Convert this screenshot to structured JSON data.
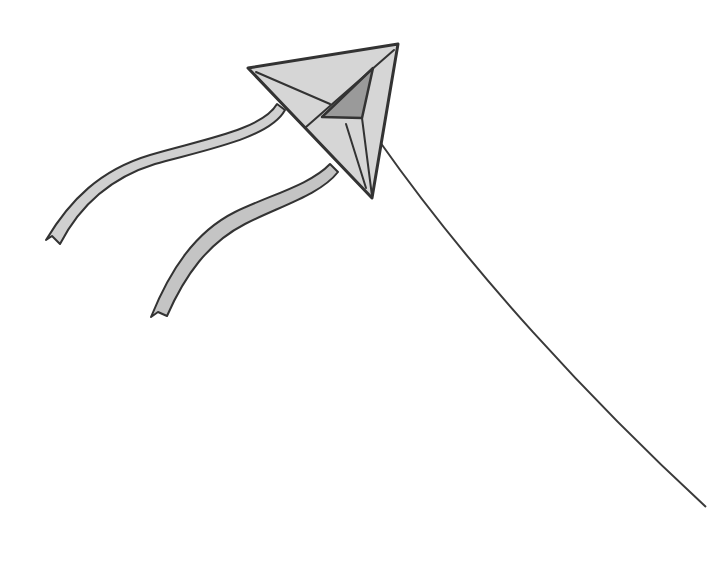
{
  "illustration": {
    "subject": "kite",
    "alt": "Line drawing of a triangular kite with two ribbon tails and a long string",
    "colors": {
      "background": "#ffffff",
      "kite_fill": "#d6d6d6",
      "kite_inner": "#9a9a9a",
      "tail_fill": "#c8c8c8",
      "outline": "#333333",
      "string": "#3a3a3a"
    }
  }
}
